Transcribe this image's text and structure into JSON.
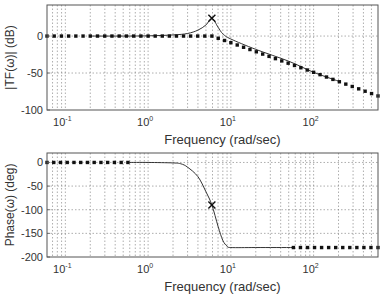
{
  "chart_data": [
    {
      "type": "line",
      "title": "",
      "xlabel": "Frequency (rad/sec)",
      "ylabel": "|TF(ω)| (dB)",
      "xscale": "log",
      "xlim": [
        0.06,
        600
      ],
      "ylim": [
        -100,
        42
      ],
      "xticks": [
        "10^-1",
        "10^0",
        "10^1",
        "10^2"
      ],
      "yticks": [
        0,
        -50,
        -100
      ],
      "grid": true,
      "series": [
        {
          "name": "magnitude (exact)",
          "style": "solid",
          "x": [
            0.2,
            0.5,
            1,
            2,
            3,
            4,
            5,
            5.9,
            7,
            8,
            10,
            20,
            50,
            100,
            200
          ],
          "y": [
            0,
            0,
            0.3,
            1.5,
            3.5,
            8,
            15,
            24,
            12,
            3,
            -4,
            -18,
            -34,
            -49,
            -61
          ]
        },
        {
          "name": "asymptote",
          "style": "dotted",
          "x": [
            0.06,
            0.2,
            1,
            5.9,
            10,
            100,
            600
          ],
          "y": [
            0,
            0,
            0,
            0,
            -9,
            -49,
            -81
          ]
        }
      ],
      "annotations": [
        {
          "marker": "x",
          "x": 5.9,
          "y": 24
        }
      ]
    },
    {
      "type": "line",
      "title": "",
      "xlabel": "Frequency (rad/sec)",
      "ylabel": "Phase(ω) (deg)",
      "xscale": "log",
      "xlim": [
        0.06,
        600
      ],
      "ylim": [
        -200,
        20
      ],
      "xticks": [
        "10^-1",
        "10^0",
        "10^1",
        "10^2"
      ],
      "yticks": [
        0,
        -50,
        -100,
        -150,
        -200
      ],
      "grid": true,
      "series": [
        {
          "name": "phase (exact)",
          "style": "solid",
          "x": [
            0.57,
            1,
            2,
            2.5,
            3,
            4,
            5,
            5.9,
            7,
            8,
            9,
            10,
            20,
            57
          ],
          "y": [
            0,
            0,
            -1,
            -3,
            -10,
            -30,
            -62,
            -90,
            -135,
            -165,
            -177,
            -180,
            -180,
            -180
          ]
        },
        {
          "name": "low-freq asymptote",
          "style": "dotted",
          "x": [
            0.06,
            0.57
          ],
          "y": [
            0,
            0
          ]
        },
        {
          "name": "high-freq asymptote",
          "style": "dotted",
          "x": [
            57,
            600
          ],
          "y": [
            -180,
            -180
          ]
        }
      ],
      "annotations": [
        {
          "marker": "x",
          "x": 5.9,
          "y": -90
        }
      ]
    }
  ],
  "labels": {
    "top_ylabel": "|TF(ω)| (dB)",
    "bottom_ylabel": "Phase(ω) (deg)",
    "xlabel": "Frequency (rad/sec)",
    "top_yticks": [
      "0",
      "-50",
      "-100"
    ],
    "bottom_yticks": [
      "0",
      "-50",
      "-100",
      "-150",
      "-200"
    ],
    "xtick_base": "10",
    "xtick_exps": [
      "-1",
      "0",
      "1",
      "2"
    ]
  }
}
